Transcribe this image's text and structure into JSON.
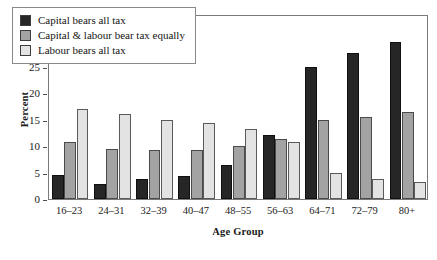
{
  "chart_data": {
    "type": "bar",
    "title": "",
    "xlabel": "Age Group",
    "ylabel": "Percent",
    "ylim": [
      0,
      35
    ],
    "yticks": [
      0,
      5,
      10,
      15,
      20,
      25,
      30,
      35
    ],
    "grid": false,
    "legend_position": "upper-left-inside",
    "categories": [
      "16–23",
      "24–31",
      "32–39",
      "40–47",
      "48–55",
      "56–63",
      "64–71",
      "72–79",
      "80+"
    ],
    "series": [
      {
        "name": "Capital bears all tax",
        "color": "#262626",
        "values": [
          4.5,
          2.8,
          3.7,
          4.4,
          6.5,
          12.2,
          25.0,
          27.7,
          29.8
        ]
      },
      {
        "name": "Capital & labour bear tax equally",
        "color": "#a3a3a3",
        "values": [
          10.8,
          9.5,
          9.3,
          9.3,
          10.0,
          11.3,
          15.0,
          15.5,
          16.5
        ]
      },
      {
        "name": "Labour bears all tax",
        "color": "#e3e3e3",
        "values": [
          17.0,
          16.0,
          15.0,
          14.3,
          13.3,
          10.7,
          5.0,
          3.8,
          3.3
        ]
      }
    ]
  }
}
